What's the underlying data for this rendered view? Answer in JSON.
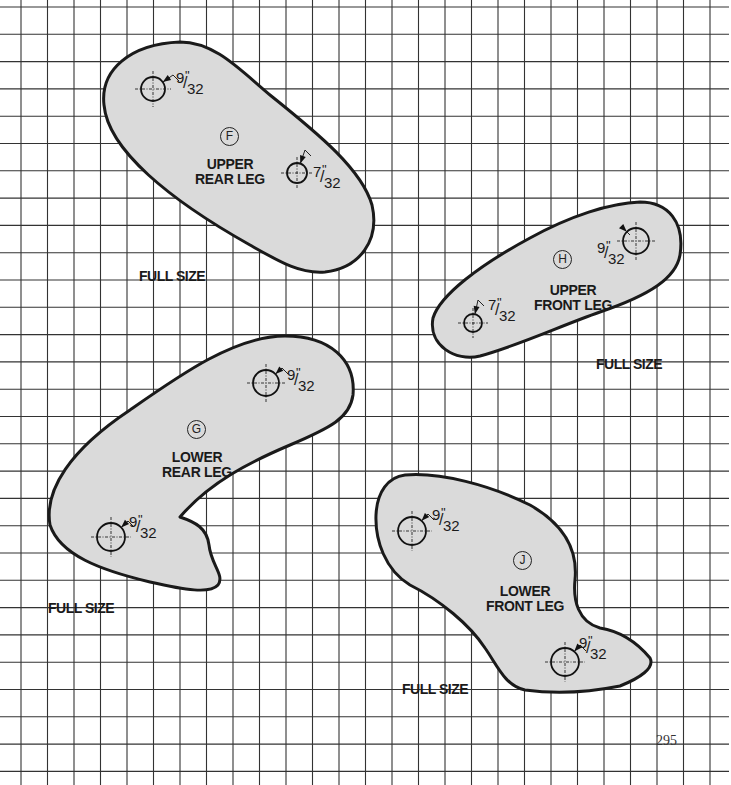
{
  "page_number": "295",
  "colors": {
    "piece_fill": "#dadada",
    "outline": "#1a1a1a",
    "grid": "#333333",
    "background": "#ffffff"
  },
  "grid": {
    "x_start": 21,
    "x_step": 26.5,
    "x_count": 27,
    "y_start": 7,
    "y_step": 27.3,
    "y_count": 29
  },
  "pieces": [
    {
      "id": "F",
      "badge": "F",
      "name_line1": "UPPER",
      "name_line2": "REAR LEG",
      "scale_label": "FULL SIZE",
      "holes": [
        {
          "numerator": "9",
          "denominator": "32",
          "inch": "\""
        },
        {
          "numerator": "7",
          "denominator": "32",
          "inch": "\""
        }
      ]
    },
    {
      "id": "H",
      "badge": "H",
      "name_line1": "UPPER",
      "name_line2": "FRONT LEG",
      "scale_label": "FULL SIZE",
      "holes": [
        {
          "numerator": "9",
          "denominator": "32",
          "inch": "\""
        },
        {
          "numerator": "7",
          "denominator": "32",
          "inch": "\""
        }
      ]
    },
    {
      "id": "G",
      "badge": "G",
      "name_line1": "LOWER",
      "name_line2": "REAR LEG",
      "scale_label": "FULL SIZE",
      "holes": [
        {
          "numerator": "9",
          "denominator": "32",
          "inch": "\""
        },
        {
          "numerator": "9",
          "denominator": "32",
          "inch": "\""
        }
      ]
    },
    {
      "id": "J",
      "badge": "J",
      "name_line1": "LOWER",
      "name_line2": "FRONT LEG",
      "scale_label": "FULL SIZE",
      "holes": [
        {
          "numerator": "9",
          "denominator": "32",
          "inch": "\""
        },
        {
          "numerator": "9",
          "denominator": "32",
          "inch": "\""
        }
      ]
    }
  ]
}
